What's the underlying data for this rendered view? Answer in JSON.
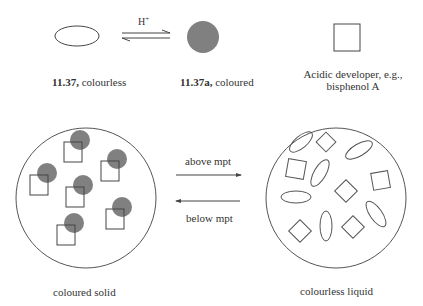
{
  "top_row": {
    "arrow_label": "H+",
    "leuco_dye": {
      "number": "11.37,",
      "desc": " colourless"
    },
    "coloured_dye": {
      "number": "11.37a,",
      "desc": " coloured"
    },
    "developer": {
      "line1": "Acidic developer, e.g.,",
      "line2": "bisphenol A"
    }
  },
  "bottom_row": {
    "above_label": "above mpt",
    "below_label": "below mpt",
    "solid_caption": "coloured solid",
    "liquid_caption": "colourless liquid"
  },
  "colors": {
    "stroke": "#555555",
    "dye_fill": "#808080",
    "background": "#ffffff"
  }
}
